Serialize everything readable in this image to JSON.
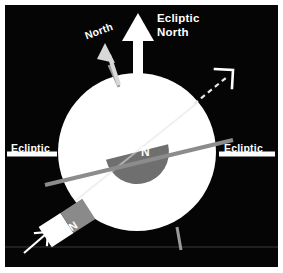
{
  "figure": {
    "background_color": "#050505",
    "border_color": "#ffffff",
    "width": 283,
    "height": 273
  },
  "colors": {
    "background": "#050505",
    "planet": "#ffffff",
    "axis_line": "#8c8c8c",
    "wedge": "#707070",
    "magnet_north": "#8a8a8a",
    "magnet_south": "#ffffff",
    "label_text": "#ffffff",
    "dashed_arrow": "#e8e8e8",
    "ecliptic_line": "#ffffff"
  },
  "labels": {
    "ecliptic_north": "Ecliptic\nNorth",
    "north": "North",
    "ecliptic_left": "Ecliptic",
    "ecliptic_right": "Ecliptic",
    "wedge_pole": "N",
    "magnet_pole": "N"
  },
  "elements": {
    "planet": {
      "name": "planet-sphere",
      "shape": "circle",
      "cx": 137,
      "cy": 152,
      "r": 79,
      "fill": "#ffffff"
    },
    "ecliptic_north_arrow": {
      "name": "ecliptic-north-arrow",
      "description": "Thick vertical white arrow pointing straight up",
      "angle_deg": 0,
      "x": 138,
      "y_top": 13,
      "y_bottom": 82
    },
    "rotation_axis_arrow": {
      "name": "north-rotation-axis-arrow",
      "description": "Tilted arrow pointing up and to the left indicating planetary rotation north pole",
      "angle_deg": -18
    },
    "magnetic_axis_line": {
      "name": "magnetic-axis-line",
      "description": "Gray line through the sphere tilted from lower-left to upper-right",
      "angle_deg": -13
    },
    "dashed_magnetic_arrow": {
      "name": "dashed-magnetic-axis-arrow",
      "description": "Dashed white arrow exiting the upper-right of the sphere along the magnetic dipole axis",
      "angle_deg": -38
    },
    "ecliptic_line_left": {
      "name": "ecliptic-line-left",
      "description": "Horizontal white line on the left marking the ecliptic plane",
      "y": 153
    },
    "ecliptic_line_right": {
      "name": "ecliptic-line-right",
      "description": "Horizontal white line on the right marking the ecliptic plane",
      "y": 153
    },
    "magnetic_wedge": {
      "name": "magnetic-dipole-wedge",
      "description": "Gray half-disc inside the sphere representing the magnetic dipole north region",
      "fill": "#707070"
    },
    "bar_magnet": {
      "name": "bar-magnet-inset",
      "description": "Tilted two-tone bar magnet with gray north half labeled N and white south half",
      "angle_deg": -33
    },
    "pointer_arrow": {
      "name": "magnet-pointer-arrow",
      "description": "Thin white arrow pointing up-right at the bar magnet",
      "angle_deg": -45
    },
    "baseline": {
      "name": "lower-horizontal-guide-line",
      "y": 247
    }
  }
}
